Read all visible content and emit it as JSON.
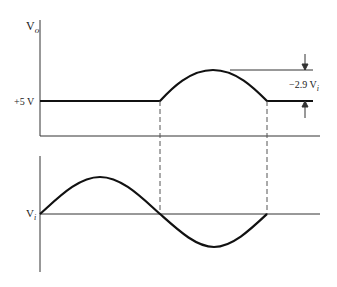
{
  "diagram": {
    "title": "",
    "output_plot": {
      "y_axis_label": "V",
      "y_axis_label_sub": "o",
      "baseline_label": "+5 V",
      "amplitude_annotation": "−2.9 V",
      "amplitude_annotation_sub": "i"
    },
    "input_plot": {
      "y_axis_label": "V",
      "y_axis_label_sub": "i"
    },
    "colors": {
      "line": "#111111",
      "axis": "#333333",
      "dashed": "#555555"
    }
  }
}
